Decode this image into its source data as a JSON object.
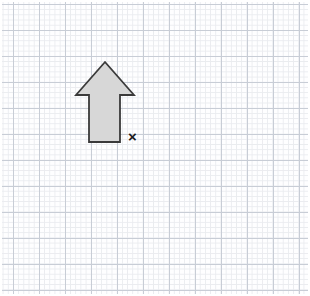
{
  "page": {
    "width": 310,
    "height": 296,
    "background_color": "#ffffff"
  },
  "grid": {
    "name": "graph-paper-grid",
    "minor_cell_px": 5.2,
    "major_cell_px": 26,
    "cells_per_major": 5,
    "origin_x_px": 13,
    "origin_y_px": 4,
    "minor_line_color": "#e9ebef",
    "major_line_color": "#c6cbd4",
    "paper_color": "#fefeff"
  },
  "shapes": [
    {
      "name": "up-arrow",
      "type": "polygon",
      "fill_color": "#d7d7d7",
      "stroke_color": "#3a3a3a",
      "stroke_width": 1.8,
      "points": "105,62 134,95 120,95 120,142 89,142 89,95 76,95",
      "description": "Shaded arrow pointing up"
    }
  ],
  "markers": [
    {
      "name": "point-marker-x",
      "label": "×",
      "text": "x",
      "color": "#1b1b1b",
      "x_px": 137,
      "y_px": 139,
      "font_weight": "bold",
      "font_size_px": 15
    }
  ],
  "chart_data": {
    "type": "scatter",
    "title": "",
    "xlabel": "",
    "ylabel": "",
    "grid": true,
    "legend": "none",
    "xlim": [
      0,
      310
    ],
    "ylim": [
      0,
      296
    ],
    "annotations": [
      {
        "label": "arrow-tip",
        "x": 105,
        "y": 62
      },
      {
        "label": "arrow-base-left",
        "x": 89,
        "y": 142
      },
      {
        "label": "arrow-base-right",
        "x": 120,
        "y": 142
      },
      {
        "label": "marker-x",
        "x": 137,
        "y": 139
      }
    ]
  }
}
